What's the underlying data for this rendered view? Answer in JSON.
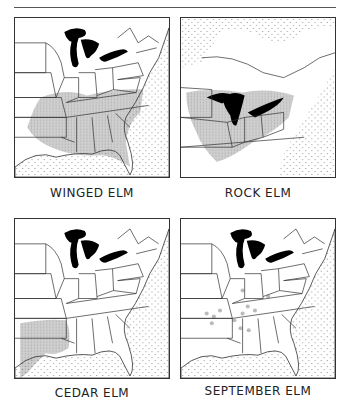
{
  "page": {
    "header_rule": true
  },
  "maps": [
    {
      "caption": "WINGED ELM",
      "region": "eastern-us",
      "range": "southeastern"
    },
    {
      "caption": "ROCK ELM",
      "region": "northeastern-us-canada",
      "range": "great-lakes-midwest"
    },
    {
      "caption": "CEDAR ELM",
      "region": "eastern-us",
      "range": "lower-mississippi-texas"
    },
    {
      "caption": "SEPTEMBER ELM",
      "region": "eastern-us",
      "range": "scattered-south-central"
    }
  ],
  "colors": {
    "frame": "#333333",
    "lakes": "#000000",
    "range_fill": "#bdbdbd",
    "ocean_dots": "#888888"
  }
}
